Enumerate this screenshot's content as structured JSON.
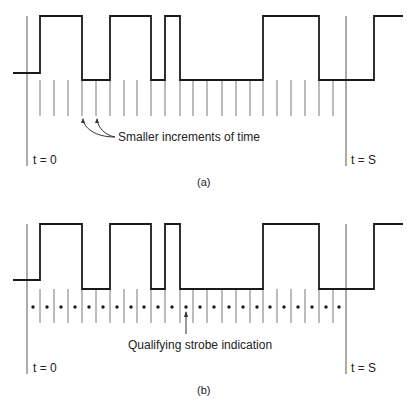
{
  "panels": [
    {
      "id": "a",
      "caption": "(a)",
      "t0_label": "t = 0",
      "tS_label": "t = S",
      "annotation": "Smaller increments of time",
      "waveform": {
        "y_high": 16,
        "y_low": 80,
        "y_base": 73,
        "start_x": 13,
        "end_x": 403,
        "transitions_x": [
          40,
          82,
          110,
          151,
          165,
          180,
          263,
          319,
          374
        ]
      },
      "ticks": {
        "y_top": 80,
        "y_bottom": 116,
        "x": [
          40,
          54,
          68,
          82,
          96,
          110,
          124,
          137,
          151,
          165,
          180,
          193,
          207,
          222,
          236,
          250,
          263,
          277,
          291,
          305,
          319,
          333
        ]
      },
      "t0_line": {
        "x": 27,
        "y1": 16,
        "y2": 166
      },
      "tS_line": {
        "x": 346,
        "y1": 16,
        "y2": 166
      }
    },
    {
      "id": "b",
      "caption": "(b)",
      "t0_label": "t = 0",
      "tS_label": "t = S",
      "annotation": "Qualifying strobe indication",
      "waveform": {
        "y_high": 224,
        "y_low": 289,
        "y_base": 280,
        "start_x": 13,
        "end_x": 403,
        "transitions_x": [
          40,
          82,
          110,
          151,
          165,
          180,
          263,
          319,
          374
        ]
      },
      "ticks": {
        "y_top": 289,
        "y_bottom": 323,
        "x": [
          40,
          54,
          68,
          82,
          96,
          110,
          124,
          137,
          151,
          165,
          180,
          193,
          207,
          222,
          236,
          250,
          263,
          277,
          291,
          305,
          319,
          333
        ]
      },
      "strobe_dots": {
        "y": 307,
        "x": [
          33,
          47,
          61,
          75,
          89,
          103,
          117,
          131,
          144,
          158,
          172,
          186,
          200,
          214,
          229,
          243,
          257,
          270,
          284,
          298,
          312,
          326,
          339
        ]
      },
      "t0_line": {
        "x": 27,
        "y1": 224,
        "y2": 374
      },
      "tS_line": {
        "x": 346,
        "y1": 224,
        "y2": 374
      }
    }
  ],
  "colors": {
    "waveform": "#1a1a1a",
    "tick": "#555555",
    "line": "#444444",
    "text": "#222222"
  }
}
